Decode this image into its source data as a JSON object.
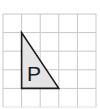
{
  "diagram": {
    "type": "grid-figure",
    "grid": {
      "columns": 5,
      "rows": 5,
      "cell_size_px": 18.6,
      "line_color": "#c8c8c8",
      "x_lines": [
        3,
        21.6,
        40.2,
        58.8,
        77.4,
        96
      ],
      "y_lines": [
        14,
        32.6,
        51.2,
        69.8,
        88.4,
        107
      ]
    },
    "shape": {
      "name": "right-triangle",
      "label": "P",
      "fill": "#e4e4e4",
      "stroke": "#1a1a1a",
      "vertices_grid": [
        [
          1,
          1
        ],
        [
          1,
          4
        ],
        [
          3,
          4
        ]
      ],
      "points": "21.6,32.6 21.6,88.4 58.8,88.4"
    },
    "label_position": {
      "x": 34,
      "y": 81
    }
  }
}
